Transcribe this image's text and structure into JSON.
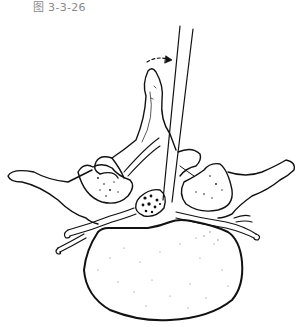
{
  "figure": {
    "caption": "图 3-3-26",
    "colors": {
      "line": "#111111",
      "background": "#ffffff",
      "caption": "#8a8a8a"
    }
  }
}
